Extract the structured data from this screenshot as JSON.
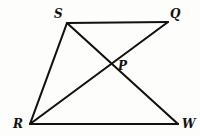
{
  "figure": {
    "name": "quadrilateral-with-diagonals",
    "background_color": "#fdfdfc",
    "stroke_color": "#111111",
    "label_color": "#111111",
    "width": 200,
    "height": 136
  },
  "labels": {
    "s": "S",
    "q": "Q",
    "p": "P",
    "r": "R",
    "w": "W"
  },
  "chart_data": {
    "type": "diagram",
    "title": "",
    "subtitle": "",
    "xlabel": "",
    "ylabel": "",
    "grid": false,
    "legend": false,
    "points": [
      {
        "label": "S",
        "x": 67,
        "y": 23,
        "label_x": 54,
        "label_y": 8,
        "role": "vertex"
      },
      {
        "label": "Q",
        "x": 168,
        "y": 22,
        "label_x": 170,
        "label_y": 8,
        "role": "vertex"
      },
      {
        "label": "P",
        "x": 112,
        "y": 65,
        "label_x": 118,
        "label_y": 60,
        "role": "intersection"
      },
      {
        "label": "R",
        "x": 30,
        "y": 124,
        "label_x": 13,
        "label_y": 118,
        "role": "vertex"
      },
      {
        "label": "W",
        "x": 178,
        "y": 124,
        "label_x": 182,
        "label_y": 118,
        "role": "vertex"
      }
    ],
    "segments": [
      {
        "name": "SQ",
        "from": "S",
        "to": "Q",
        "x1": 67,
        "y1": 23,
        "x2": 168,
        "y2": 22,
        "kind": "side"
      },
      {
        "name": "SR",
        "from": "S",
        "to": "R",
        "x1": 67,
        "y1": 23,
        "x2": 30,
        "y2": 124,
        "kind": "side"
      },
      {
        "name": "RW",
        "from": "R",
        "to": "W",
        "x1": 30,
        "y1": 124,
        "x2": 178,
        "y2": 124,
        "kind": "side"
      },
      {
        "name": "QW",
        "from": "Q",
        "to": "W",
        "x1": 168,
        "y1": 22,
        "x2": 178,
        "y2": 124,
        "kind": "side-implied"
      },
      {
        "name": "SW",
        "from": "S",
        "to": "W",
        "x1": 67,
        "y1": 23,
        "x2": 178,
        "y2": 124,
        "kind": "diagonal"
      },
      {
        "name": "RQ",
        "from": "R",
        "to": "Q",
        "x1": 30,
        "y1": 124,
        "x2": 168,
        "y2": 22,
        "kind": "diagonal"
      }
    ],
    "intersection": {
      "label": "P",
      "of": [
        "SW",
        "RQ"
      ],
      "x": 112,
      "y": 65
    }
  }
}
